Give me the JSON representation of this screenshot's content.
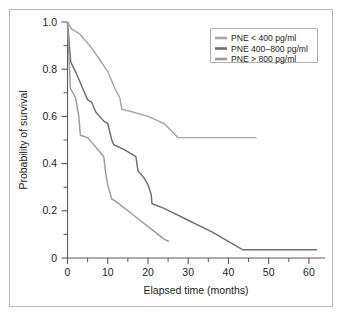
{
  "chart_data": {
    "type": "line",
    "title": "",
    "xlabel": "Elapsed time (months)",
    "ylabel": "Probability of survival",
    "xlim": [
      0,
      64
    ],
    "ylim": [
      0,
      1.0
    ],
    "grid": false,
    "legend_position": "top-right",
    "x_ticks": [
      0,
      10,
      20,
      30,
      40,
      50,
      60
    ],
    "x_tick_labels": [
      "0",
      "10",
      "20",
      "30",
      "40",
      "50",
      "60"
    ],
    "x_minor_ticks": [
      5,
      15,
      25,
      35,
      45,
      55
    ],
    "y_ticks": [
      0,
      0.2,
      0.4,
      0.6,
      0.8,
      1.0
    ],
    "y_tick_labels": [
      "0",
      "0.2",
      "0.4",
      "0.6",
      "0.8",
      "1.0"
    ],
    "y_minor_ticks": [
      0.1,
      0.3,
      0.5,
      0.7,
      0.9
    ],
    "series": [
      {
        "name": "PNE < 400 pg/ml",
        "color": "#a3a8a3",
        "points": [
          [
            0,
            1.0
          ],
          [
            1,
            0.97
          ],
          [
            2,
            0.96
          ],
          [
            3,
            0.95
          ],
          [
            4,
            0.93
          ],
          [
            6,
            0.89
          ],
          [
            8,
            0.84
          ],
          [
            10,
            0.79
          ],
          [
            12,
            0.71
          ],
          [
            13,
            0.68
          ],
          [
            13.5,
            0.63
          ],
          [
            16,
            0.62
          ],
          [
            20,
            0.6
          ],
          [
            24,
            0.57
          ],
          [
            27.5,
            0.51
          ],
          [
            47,
            0.51
          ]
        ]
      },
      {
        "name": "PNE 400–800 pg/ml",
        "color": "#6f6f6f",
        "points": [
          [
            0,
            1.0
          ],
          [
            0.8,
            0.83
          ],
          [
            2,
            0.79
          ],
          [
            4,
            0.71
          ],
          [
            5,
            0.67
          ],
          [
            6,
            0.66
          ],
          [
            7,
            0.62
          ],
          [
            9,
            0.58
          ],
          [
            10,
            0.57
          ],
          [
            11,
            0.5
          ],
          [
            11.5,
            0.48
          ],
          [
            14,
            0.46
          ],
          [
            16,
            0.44
          ],
          [
            17,
            0.43
          ],
          [
            17.5,
            0.37
          ],
          [
            19,
            0.34
          ],
          [
            20,
            0.31
          ],
          [
            20.8,
            0.27
          ],
          [
            21,
            0.23
          ],
          [
            24,
            0.21
          ],
          [
            30,
            0.16
          ],
          [
            36,
            0.11
          ],
          [
            43.5,
            0.035
          ],
          [
            62,
            0.035
          ]
        ]
      },
      {
        "name": "PNE > 800 pg/ml",
        "color": "#9b9b9b",
        "points": [
          [
            0,
            1.0
          ],
          [
            0.7,
            0.72
          ],
          [
            2,
            0.68
          ],
          [
            2.8,
            0.6
          ],
          [
            3.2,
            0.52
          ],
          [
            5,
            0.51
          ],
          [
            6,
            0.49
          ],
          [
            8,
            0.45
          ],
          [
            9,
            0.43
          ],
          [
            9.5,
            0.36
          ],
          [
            10,
            0.31
          ],
          [
            11,
            0.25
          ],
          [
            12,
            0.24
          ],
          [
            15,
            0.2
          ],
          [
            18,
            0.16
          ],
          [
            21,
            0.12
          ],
          [
            24,
            0.08
          ],
          [
            25.2,
            0.07
          ]
        ]
      }
    ]
  },
  "legend": {
    "entries": [
      {
        "label": "PNE < 400 pg/ml"
      },
      {
        "label": "PNE 400–800 pg/ml"
      },
      {
        "label": "PNE > 800 pg/ml"
      }
    ]
  }
}
